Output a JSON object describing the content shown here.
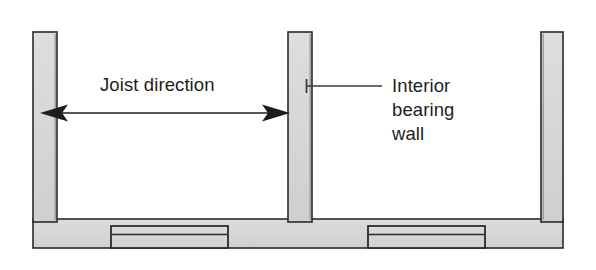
{
  "figure": {
    "type": "construction-cross-section",
    "background_color": "#ffffff",
    "title_visible": false
  },
  "style": {
    "concrete_fill": "#d5d5d5",
    "concrete_fill_light": "#dcdcdc",
    "outline_color": "#2b2b2b",
    "shadow_color": "#8c8c8c",
    "text_color": "#1d1d1d",
    "arrow_color": "#1d1d1d",
    "leader_color": "#3a3a3a"
  },
  "annotations": {
    "joist_direction": {
      "label": "Joist direction",
      "arrow_style": "double-headed",
      "arrow_left_x": 40,
      "arrow_right_x": 290,
      "arrow_y": 113
    },
    "interior_bearing_wall": {
      "label_lines": [
        "Interior",
        "bearing",
        "wall"
      ],
      "label_full": "Interior bearing wall",
      "leader_from_x": 382,
      "leader_to_x": 306,
      "leader_y": 86
    }
  },
  "geometry": {
    "slab": {
      "x": 33,
      "y": 219,
      "width": 530,
      "height": 29
    },
    "walls": [
      {
        "name": "left-exterior-wall",
        "x": 33,
        "y": 32,
        "width": 24,
        "height": 190
      },
      {
        "name": "interior-bearing-wall",
        "x": 288,
        "y": 32,
        "width": 24,
        "height": 190
      },
      {
        "name": "right-exterior-wall",
        "x": 541,
        "y": 32,
        "width": 22,
        "height": 190
      }
    ],
    "footings": [
      {
        "name": "left-footing-pad",
        "x": 111,
        "y": 226,
        "width": 117,
        "height": 22
      },
      {
        "name": "right-footing-pad",
        "x": 368,
        "y": 226,
        "width": 117,
        "height": 22
      }
    ]
  }
}
